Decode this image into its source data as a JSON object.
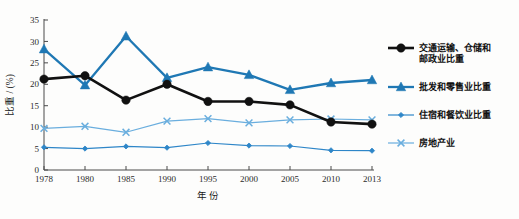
{
  "chart_data": {
    "type": "line",
    "title": "",
    "xlabel": "年 份",
    "ylabel": "比重 / (%)",
    "x": [
      1978,
      1980,
      1985,
      1990,
      1995,
      2000,
      2005,
      2010,
      2013
    ],
    "xtick_labels": [
      "1978",
      "1980",
      "1985",
      "1990",
      "1995",
      "2000",
      "2005",
      "2010",
      "2013"
    ],
    "ytick_labels": [
      "0",
      "5",
      "10",
      "15",
      "20",
      "25",
      "30",
      "35"
    ],
    "ytick_values": [
      0,
      5,
      10,
      15,
      20,
      25,
      30,
      35
    ],
    "ylim": [
      0,
      35
    ],
    "grid": false,
    "legend_position": "right",
    "series": [
      {
        "name": "交通运输、仓储和邮政业比重",
        "marker": "circle",
        "color": "#111111",
        "values": [
          21.2,
          22.0,
          16.3,
          20.0,
          16.0,
          16.0,
          15.2,
          11.2,
          10.7
        ]
      },
      {
        "name": "批发和零售业比重",
        "marker": "triangle",
        "color": "#1f78b4",
        "values": [
          28.2,
          19.8,
          31.2,
          21.5,
          24.0,
          22.2,
          18.7,
          20.3,
          21.0
        ]
      },
      {
        "name": "住宿和餐饮业比重",
        "marker": "diamond",
        "color": "#2e86c8",
        "values": [
          5.3,
          5.0,
          5.5,
          5.2,
          6.3,
          5.7,
          5.6,
          4.6,
          4.5
        ]
      },
      {
        "name": "房地产业",
        "marker": "x",
        "color": "#6aaede",
        "values": [
          9.7,
          10.2,
          8.8,
          11.4,
          12.0,
          11.0,
          11.7,
          11.9,
          11.7
        ]
      }
    ]
  },
  "legend": {
    "items": [
      {
        "label_line1": "交通运输、仓储和",
        "label_line2": "邮政业比重",
        "marker": "circle",
        "color": "#111111"
      },
      {
        "label_line1": "批发和零售业比重",
        "label_line2": "",
        "marker": "triangle",
        "color": "#1f78b4"
      },
      {
        "label_line1": "住宿和餐饮业比重",
        "label_line2": "",
        "marker": "diamond",
        "color": "#2e86c8"
      },
      {
        "label_line1": "房地产业",
        "label_line2": "",
        "marker": "x",
        "color": "#6aaede"
      }
    ]
  },
  "axes": {
    "y_title": "比重 / (%)",
    "x_title": "年 份"
  },
  "colors": {
    "black_series": "#111111",
    "blue_series": "#1f78b4",
    "mid_blue_series": "#2e86c8",
    "light_blue_series": "#6aaede",
    "axis": "#4a4a4a",
    "background": "#fdfdfc"
  }
}
